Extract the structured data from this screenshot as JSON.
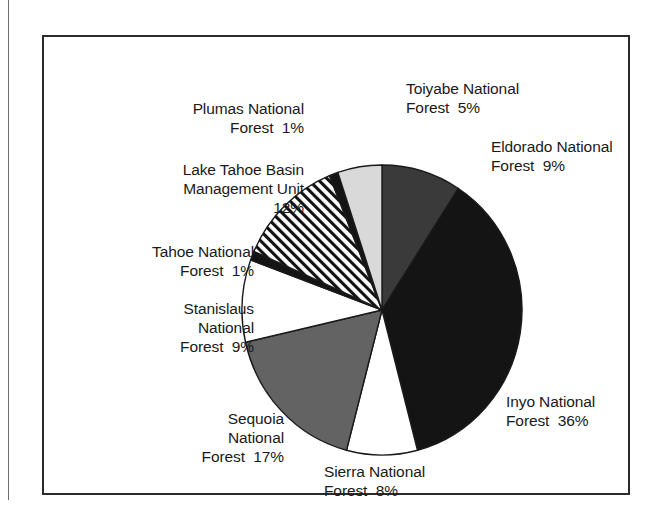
{
  "chart_data": {
    "type": "pie",
    "title": "",
    "subtitle": "",
    "xlabel": "",
    "ylabel": "",
    "units": "percent",
    "legend_position": "none",
    "labels_position": "outside",
    "grid": false,
    "total": 98,
    "start_angle_deg": 0,
    "direction": "clockwise",
    "categories": [
      "Eldorado National Forest",
      "Inyo National Forest",
      "Sierra National Forest",
      "Sequoia National Forest",
      "Stanislaus National Forest",
      "Tahoe National Forest",
      "Lake Tahoe Basin Management Unit",
      "Plumas National Forest",
      "Toiyabe National Forest"
    ],
    "values": [
      9,
      36,
      8,
      17,
      9,
      1,
      12,
      1,
      5
    ],
    "slices": [
      {
        "name": "Eldorado National Forest",
        "value": 9,
        "label": "Eldorado National\nForest  9%",
        "fill": "#3a3a3a",
        "pattern": "solid"
      },
      {
        "name": "Inyo National Forest",
        "value": 36,
        "label": "Inyo National\nForest  36%",
        "fill": "#141414",
        "pattern": "solid"
      },
      {
        "name": "Sierra National Forest",
        "value": 8,
        "label": "Sierra National\nForest  8%",
        "fill": "#ffffff",
        "pattern": "solid"
      },
      {
        "name": "Sequoia National Forest",
        "value": 17,
        "label": "Sequoia\nNational\nForest  17%",
        "fill": "#636363",
        "pattern": "solid"
      },
      {
        "name": "Stanislaus National Forest",
        "value": 9,
        "label": "Stanislaus\nNational\nForest  9%",
        "fill": "#ffffff",
        "pattern": "solid"
      },
      {
        "name": "Tahoe National Forest",
        "value": 1,
        "label": "Tahoe National\nForest  1%",
        "fill": "#141414",
        "pattern": "solid"
      },
      {
        "name": "Lake Tahoe Basin Management Unit",
        "value": 12,
        "label": "Lake Tahoe Basin\nManagement Unit\n12%",
        "fill": "#ffffff",
        "pattern": "diagonal-hatch"
      },
      {
        "name": "Plumas National Forest",
        "value": 1,
        "label": "Plumas National\nForest  1%",
        "fill": "#141414",
        "pattern": "solid"
      },
      {
        "name": "Toiyabe National Forest",
        "value": 5,
        "label": "Toiyabe National\nForest  5%",
        "fill": "#d9d9d9",
        "pattern": "solid"
      }
    ]
  },
  "labels": {
    "toiyabe": "Toiyabe National\nForest  5%",
    "eldorado": "Eldorado National\nForest  9%",
    "plumas": "Plumas National\nForest  1%",
    "lake_tahoe": "Lake Tahoe Basin\nManagement Unit\n12%",
    "tahoe": "Tahoe National\nForest  1%",
    "stanislaus": "Stanislaus\nNational\nForest  9%",
    "sequoia": "Sequoia\nNational\nForest  17%",
    "sierra": "Sierra National\nForest  8%",
    "inyo": "Inyo National\nForest  36%"
  },
  "colors": {
    "outline": "#1a1a1a",
    "frame": "#2b2b2b",
    "background": "#ffffff",
    "text": "#1a1a1a"
  }
}
